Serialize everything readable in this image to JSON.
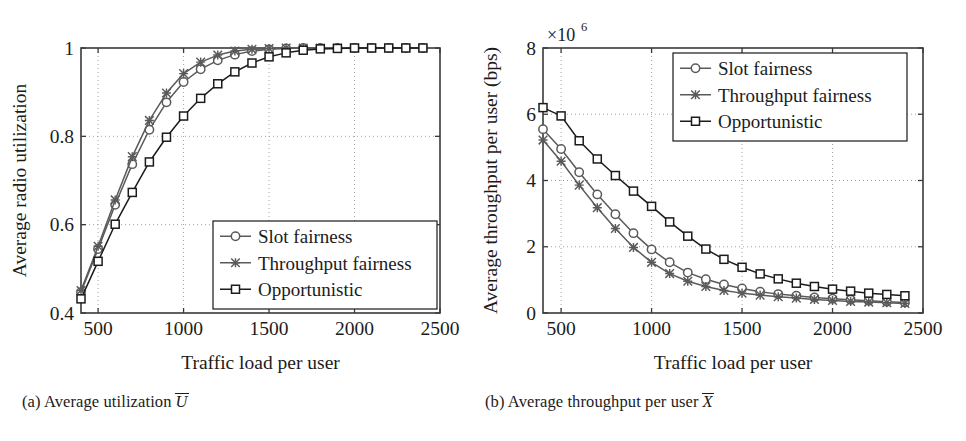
{
  "figure": {
    "panels": [
      {
        "id": "a",
        "caption_prefix": "(a) Average utilization",
        "caption_symbol": "U",
        "xlabel": "Traffic load per user",
        "ylabel": "Average radio utilization",
        "exponent_label": "",
        "xticks": [
          "500",
          "1000",
          "1500",
          "2000",
          "2500"
        ],
        "yticks": [
          "0.4",
          "0.6",
          "0.8",
          "1"
        ],
        "legend": [
          "Slot fairness",
          "Throughput fairness",
          "Opportunistic"
        ]
      },
      {
        "id": "b",
        "caption_prefix": "(b) Average throughput per user",
        "caption_symbol": "X",
        "xlabel": "Traffic load per user",
        "ylabel": "Average throughput per user (bps)",
        "exponent_label": "×10",
        "exponent_sup": "6",
        "xticks": [
          "500",
          "1000",
          "1500",
          "2000",
          "2500"
        ],
        "yticks": [
          "0",
          "2",
          "4",
          "6",
          "8"
        ],
        "legend": [
          "Slot fairness",
          "Throughput fairness",
          "Opportunistic"
        ]
      }
    ]
  },
  "chart_data": [
    {
      "type": "line",
      "panel": "a",
      "title": "(a) Average utilization Ū",
      "xlabel": "Traffic load per user",
      "ylabel": "Average radio utilization",
      "xlim": [
        400,
        2500
      ],
      "ylim": [
        0.4,
        1.0
      ],
      "xticks": [
        500,
        1000,
        1500,
        2000,
        2500
      ],
      "yticks": [
        0.4,
        0.6,
        0.8,
        1.0
      ],
      "grid": true,
      "legend_position": "lower-right",
      "x": [
        400,
        500,
        600,
        700,
        800,
        900,
        1000,
        1100,
        1200,
        1300,
        1400,
        1500,
        1600,
        1700,
        1800,
        1900,
        2000,
        2100,
        2200,
        2300,
        2400
      ],
      "series": [
        {
          "name": "Slot fairness",
          "marker": "circle",
          "color": "#5a5a5a",
          "values": [
            0.447,
            0.545,
            0.645,
            0.737,
            0.815,
            0.877,
            0.923,
            0.952,
            0.972,
            0.985,
            0.993,
            0.997,
            0.999,
            1.0,
            1.0,
            1.0,
            1.0,
            1.0,
            1.0,
            1.0,
            1.0
          ]
        },
        {
          "name": "Throughput fairness",
          "marker": "cross",
          "color": "#5a5a5a",
          "values": [
            0.451,
            0.551,
            0.656,
            0.754,
            0.836,
            0.898,
            0.942,
            0.968,
            0.984,
            0.993,
            0.997,
            0.999,
            1.0,
            1.0,
            1.0,
            1.0,
            1.0,
            1.0,
            1.0,
            1.0,
            1.0
          ]
        },
        {
          "name": "Opportunistic",
          "marker": "square",
          "color": "#1b1b1b",
          "values": [
            0.432,
            0.517,
            0.601,
            0.673,
            0.742,
            0.798,
            0.846,
            0.886,
            0.919,
            0.946,
            0.966,
            0.98,
            0.989,
            0.995,
            0.998,
            0.999,
            1.0,
            1.0,
            1.0,
            1.0,
            1.0
          ]
        }
      ]
    },
    {
      "type": "line",
      "panel": "b",
      "title": "(b) Average throughput per user X̄",
      "xlabel": "Traffic load per user",
      "ylabel": "Average throughput per user (bps)",
      "y_exponent": 1000000,
      "y_exponent_label": "×10⁶",
      "xlim": [
        400,
        2500
      ],
      "ylim": [
        0,
        8
      ],
      "xticks": [
        500,
        1000,
        1500,
        2000,
        2500
      ],
      "yticks": [
        0,
        2,
        4,
        6,
        8
      ],
      "grid": true,
      "legend_position": "upper-right",
      "x": [
        400,
        500,
        600,
        700,
        800,
        900,
        1000,
        1100,
        1200,
        1300,
        1400,
        1500,
        1600,
        1700,
        1800,
        1900,
        2000,
        2100,
        2200,
        2300,
        2400
      ],
      "series": [
        {
          "name": "Slot fairness",
          "marker": "circle",
          "color": "#5a5a5a",
          "values": [
            5.55,
            4.95,
            4.25,
            3.58,
            2.98,
            2.41,
            1.92,
            1.53,
            1.22,
            1.02,
            0.86,
            0.74,
            0.64,
            0.57,
            0.52,
            0.47,
            0.43,
            0.4,
            0.37,
            0.34,
            0.32
          ]
        },
        {
          "name": "Throughput fairness",
          "marker": "cross",
          "color": "#5a5a5a",
          "values": [
            5.22,
            4.58,
            3.86,
            3.18,
            2.55,
            1.98,
            1.53,
            1.19,
            0.96,
            0.8,
            0.68,
            0.6,
            0.54,
            0.49,
            0.45,
            0.41,
            0.38,
            0.35,
            0.33,
            0.31,
            0.29
          ]
        },
        {
          "name": "Opportunistic",
          "marker": "square",
          "color": "#1b1b1b",
          "values": [
            6.2,
            5.95,
            5.2,
            4.65,
            4.15,
            3.68,
            3.22,
            2.75,
            2.32,
            1.93,
            1.62,
            1.38,
            1.18,
            1.03,
            0.9,
            0.8,
            0.72,
            0.66,
            0.6,
            0.56,
            0.52
          ]
        }
      ]
    }
  ]
}
